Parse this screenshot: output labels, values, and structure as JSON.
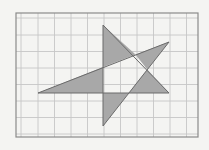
{
  "figure": {
    "type": "geometry-grid-diagram",
    "grid": {
      "columns": 11,
      "rows": 7,
      "frame": {
        "x": 16,
        "y": 13,
        "width": 182,
        "height": 124
      },
      "vertical_lines_x": [
        21,
        38,
        54.5,
        71,
        87.5,
        104,
        120.5,
        137,
        153.5,
        170,
        186.5
      ],
      "horizontal_lines_y": [
        18,
        35,
        51.5,
        68,
        84.5,
        101,
        117.5,
        134
      ]
    },
    "vertices": {
      "top": [
        103,
        25
      ],
      "bottom": [
        103,
        126
      ],
      "left": [
        38,
        93
      ],
      "upper_right": [
        169,
        42
      ],
      "lower_right": [
        169,
        93
      ]
    },
    "edges": [
      [
        [
          103,
          25
        ],
        [
          103,
          126
        ]
      ],
      [
        [
          103,
          25
        ],
        [
          169,
          93
        ]
      ],
      [
        [
          38,
          93
        ],
        [
          169,
          93
        ]
      ],
      [
        [
          38,
          93
        ],
        [
          169,
          42
        ]
      ],
      [
        [
          169,
          42
        ],
        [
          103,
          126
        ]
      ]
    ],
    "shaded_regions": [
      [
        [
          103,
          25
        ],
        [
          135.5,
          54.5
        ],
        [
          103,
          67
        ]
      ],
      [
        [
          38,
          93
        ],
        [
          103,
          67
        ],
        [
          103,
          93
        ]
      ],
      [
        [
          135.5,
          54.5
        ],
        [
          169,
          42
        ],
        [
          147.3,
          69.6
        ]
      ],
      [
        [
          147.3,
          69.6
        ],
        [
          169,
          93
        ],
        [
          128.8,
          93
        ]
      ],
      [
        [
          103,
          93
        ],
        [
          128.8,
          93
        ],
        [
          103,
          126
        ]
      ]
    ],
    "colors": {
      "background": "#f4f4f2",
      "grid": "#c6c6c6",
      "frame": "#8a8a8a",
      "shade": "#a8a8a8",
      "edge": "#6a6a6a"
    }
  }
}
